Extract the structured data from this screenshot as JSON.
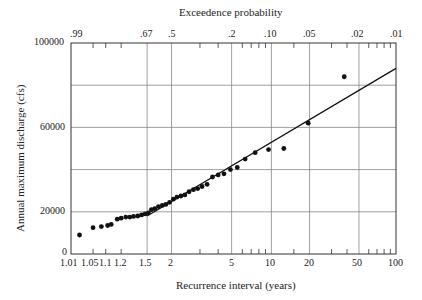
{
  "chart_data": {
    "type": "scatter",
    "title": "Exceedence probability",
    "xlabel": "Recurrence interval (years)",
    "ylabel": "Annual maximum discharge (cfs)",
    "x_scale": "probability (Gumbel/extreme-value)",
    "x_ticks_bottom": [
      "1.01",
      "1.05",
      "1.1",
      "1.2",
      "1.5",
      "2",
      "5",
      "10",
      "20",
      "50",
      "100"
    ],
    "x_ticks_top": [
      ".99",
      ".67",
      ".5",
      ".2",
      ".10",
      ".05",
      ".02",
      ".01"
    ],
    "y_ticks": [
      "0",
      "20000",
      "60000",
      "100000"
    ],
    "ylim": [
      0,
      100000
    ],
    "xlim": [
      1.01,
      100
    ],
    "grid": true,
    "series": [
      {
        "name": "Observed annual maxima",
        "marker": "filled-circle",
        "points": [
          [
            1.02,
            9000
          ],
          [
            1.05,
            12500
          ],
          [
            1.08,
            13000
          ],
          [
            1.11,
            13500
          ],
          [
            1.13,
            14000
          ],
          [
            1.17,
            16500
          ],
          [
            1.2,
            17000
          ],
          [
            1.24,
            17500
          ],
          [
            1.28,
            17500
          ],
          [
            1.32,
            17800
          ],
          [
            1.37,
            18000
          ],
          [
            1.42,
            18500
          ],
          [
            1.47,
            19000
          ],
          [
            1.52,
            19500
          ],
          [
            1.57,
            21000
          ],
          [
            1.63,
            21500
          ],
          [
            1.7,
            22500
          ],
          [
            1.78,
            23000
          ],
          [
            1.86,
            23500
          ],
          [
            1.95,
            24500
          ],
          [
            2.05,
            26000
          ],
          [
            2.15,
            27000
          ],
          [
            2.27,
            27500
          ],
          [
            2.4,
            28000
          ],
          [
            2.55,
            29500
          ],
          [
            2.72,
            30500
          ],
          [
            2.9,
            31000
          ],
          [
            3.1,
            32000
          ],
          [
            3.35,
            33000
          ],
          [
            3.65,
            36500
          ],
          [
            4.0,
            37500
          ],
          [
            4.4,
            38000
          ],
          [
            4.9,
            40000
          ],
          [
            5.5,
            41000
          ],
          [
            6.3,
            45000
          ],
          [
            7.5,
            48000
          ],
          [
            9.5,
            49500
          ],
          [
            12.5,
            50000
          ],
          [
            19.5,
            62000
          ],
          [
            38,
            84000
          ]
        ]
      },
      {
        "name": "Fitted line",
        "type": "line",
        "points": [
          [
            1.5,
            18000
          ],
          [
            100,
            88000
          ]
        ]
      }
    ]
  }
}
